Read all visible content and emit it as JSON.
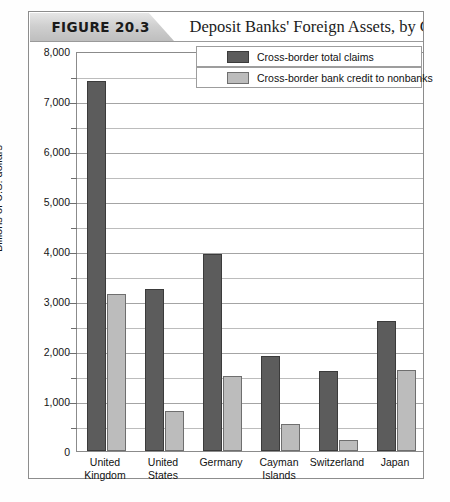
{
  "figure": {
    "number_label": "FIGURE 20.3",
    "title": "Deposit Banks' Foreign Assets, by Country"
  },
  "chart_data": {
    "type": "bar",
    "title": "Deposit Banks' Foreign Assets, by Country",
    "xlabel": "",
    "ylabel": "Billions of U.S. dollars",
    "ylim": [
      0,
      8000
    ],
    "ytick_labels": [
      "0",
      "1,000",
      "2,000",
      "3,000",
      "4,000",
      "5,000",
      "6,000",
      "7,000",
      "8,000"
    ],
    "ytick_values": [
      0,
      1000,
      2000,
      3000,
      4000,
      5000,
      6000,
      7000,
      8000
    ],
    "minor_tick_values": [
      500,
      1500,
      2500,
      3500,
      4500,
      5500,
      6500,
      7500
    ],
    "grid": true,
    "legend_position": "top-right",
    "categories": [
      "United Kingdom",
      "United States",
      "Germany",
      "Cayman Islands",
      "Switzerland",
      "Japan"
    ],
    "category_lines": [
      [
        "United",
        "Kingdom"
      ],
      [
        "United",
        "States"
      ],
      [
        "Germany",
        ""
      ],
      [
        "Cayman",
        "Islands"
      ],
      [
        "Switzerland",
        ""
      ],
      [
        "Japan",
        ""
      ]
    ],
    "series": [
      {
        "name": "Cross-border total claims",
        "color": "#5c5c5c",
        "values": [
          7400,
          3250,
          3950,
          1900,
          1600,
          2600
        ]
      },
      {
        "name": "Cross-border bank credit to nonbanks",
        "color": "#bcbcbc",
        "values": [
          3150,
          800,
          1500,
          550,
          230,
          1620
        ]
      }
    ]
  }
}
